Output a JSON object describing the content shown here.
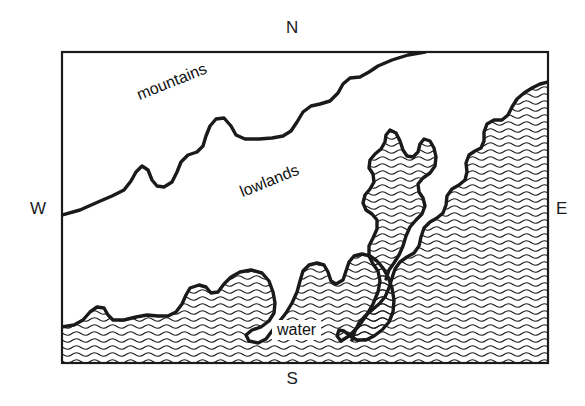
{
  "figure": {
    "type": "map",
    "title": "",
    "background_color": "#ffffff",
    "ink_color": "#1a1a1a",
    "frame": {
      "x": 62,
      "y": 52,
      "width": 486,
      "height": 311,
      "stroke": "#1a1a1a",
      "stroke_width": 2
    }
  },
  "compass": {
    "north": "N",
    "south": "S",
    "west": "W",
    "east": "E"
  },
  "regions": [
    {
      "key": "mountains",
      "label": "mountains",
      "fill": "none",
      "rotation_deg": -22
    },
    {
      "key": "lowlands",
      "label": "lowlands",
      "fill": "none",
      "rotation_deg": -22
    },
    {
      "key": "water",
      "label": "water",
      "fill": "wavy-hatch",
      "rotation_deg": 0
    }
  ],
  "labels": {
    "mountains": "mountains",
    "lowlands": "lowlands",
    "water": "water"
  },
  "hatch": {
    "name": "wavy-hatch",
    "line_spacing_px": 7,
    "wavelength_px": 9,
    "amplitude_px": 1.6,
    "stroke": "#1a1a1a",
    "stroke_width": 1
  },
  "boundaries": {
    "mountain_front": "M62,215 L80,210 L98,202 L112,196 L124,190 L131,181 L136,172 L142,166 L148,170 L152,180 L157,186 L164,187 L172,182 L177,172 L181,162 L188,155 L197,152 L203,146 L206,136 L210,126 L216,119 L224,118 L231,126 L236,135 L245,139 L259,139 L272,138 L283,136 L291,131 L297,122 L303,112 L311,106 L320,104 L330,101 L338,93 L343,84 L350,78 L360,77 L369,72 L378,66 L392,60 L408,55 L425,52",
    "coastline_main": "M62,327 L74,325 L83,320 L90,312 L97,307 L104,308 L108,315 L113,320 L124,320 L136,317 L147,315 L158,316 L168,316 L176,312 L182,304 L186,295 L190,288 L199,285 L206,287 L211,293 L218,292 L224,284 L231,277 L240,272 L251,270 L262,273 L269,281 L273,292 L275,303 L274,313 L269,321 L261,327 L252,330 L246,335 L249,341 L258,343 L266,339 L272,331 L279,322 L286,313 L292,303 L297,292 L300,281 L303,271 L309,265 L317,263 L324,265 L328,272 L331,281 L336,284 L343,280 L346,271 L349,262 L354,256 L362,254 L370,256 L377,261 L383,268 L388,277 L392,288 L394,300 L393,312 L389,322 L382,330 L374,336 L366,340 L357,340 L350,336 L344,331 L339,330 L337,336 L341,341",
    "inlet_west_shore": "M341,341 L349,336 L358,327 L366,316 L373,304 L378,292 L380,281 L378,271 L373,264 L369,256 L369,246 L373,238 L377,229 L377,220 L372,214 L366,210 L363,203 L365,195 L370,189 L374,182 L373,174 L369,168 L370,160 L375,154 L381,149 L385,142 L386,135 L390,130 L396,133 L400,141 L403,150 L407,156 L413,157 L418,152 L420,144 L424,139 L430,141 L434,148 L436,157 L435,166 L430,173 L423,178 L418,184 L419,192 L423,198 L425,206 L422,214 L416,220 L410,227 L406,236 L403,246 L399,255 L394,263 L389,270 L386,279",
    "east_shore": "M548,82 L540,84 L532,88 L524,93 L517,99 L512,107 L508,115 L502,120 L494,120 L487,124 L484,132 L484,141 L481,148 L475,151 L469,155 L466,163 L467,172 L465,180 L459,185 L452,189 L447,196 L446,205 L443,213 L437,218 L430,222 L424,228 L421,237 L419,246 L414,253 L407,257 L400,262 L395,269 L392,278 L389,288 L385,297 L379,304 L372,310 L365,316 L359,323 L355,331 L352,340"
  }
}
